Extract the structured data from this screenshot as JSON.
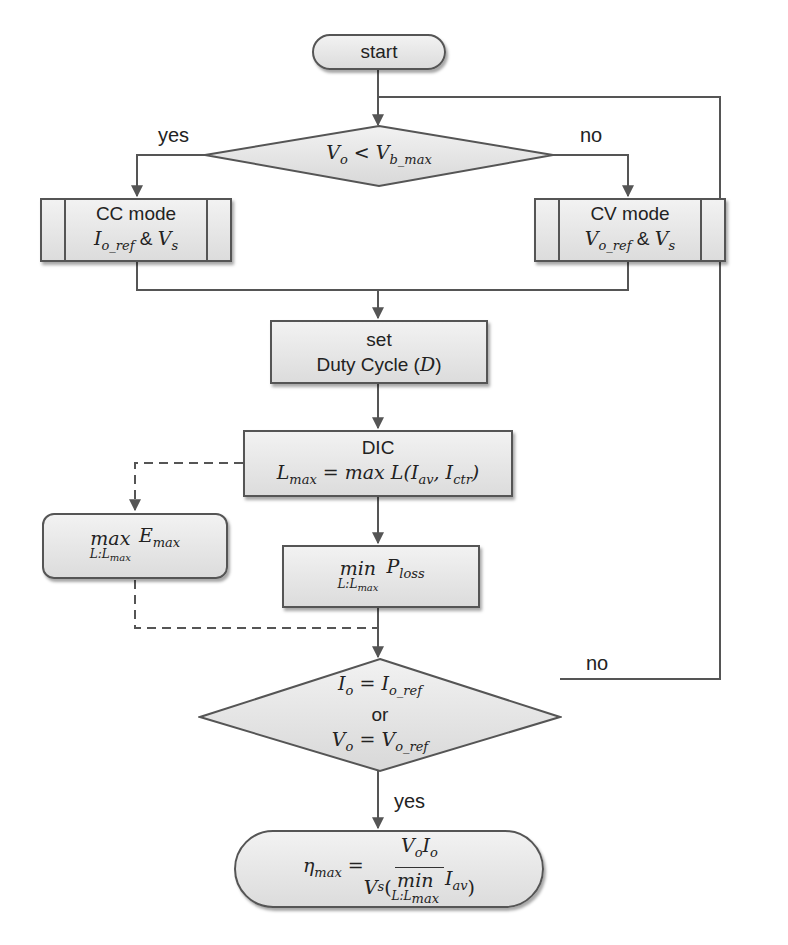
{
  "colors": {
    "stroke": "#555555",
    "fill_top": "#f2f2f2",
    "fill_bottom": "#dcdcdc",
    "text": "#222222"
  },
  "nodes": {
    "start": {
      "label": "start"
    },
    "decision1": {
      "lhs": "V",
      "lhs_sub": "o",
      "op": " < ",
      "rhs": "V",
      "rhs_sub": "b_max"
    },
    "cc_mode": {
      "title": "CC mode",
      "var": "I",
      "var_sub": "o_ref",
      "amp": " & ",
      "var2": "V",
      "var2_sub": "s"
    },
    "cv_mode": {
      "title": "CV mode",
      "var": "V",
      "var_sub": "o_ref",
      "amp": " & ",
      "var2": "V",
      "var2_sub": "s"
    },
    "set_duty": {
      "line1": "set",
      "line2": "Duty Cycle (",
      "var": "D",
      "close": ")"
    },
    "dic": {
      "title": "DIC",
      "lhs": "L",
      "lhs_sub": "max",
      "eq": " = max L(",
      "a": "I",
      "a_sub": "av",
      "comma": ", ",
      "b": "I",
      "b_sub": "ctr",
      "close": ")"
    },
    "max_e": {
      "op": "max",
      "limit": "L:L",
      "limit_sub": "max",
      "var": "E",
      "var_sub": "max"
    },
    "min_p": {
      "op": "min",
      "limit": "L:L",
      "limit_sub": "max",
      "var": "P",
      "var_sub": "loss"
    },
    "decision2": {
      "line1_lhs": "I",
      "line1_lhs_sub": "o",
      "line1_eq": " = ",
      "line1_rhs": "I",
      "line1_rhs_sub": "o_ref",
      "or": "or",
      "line2_lhs": "V",
      "line2_lhs_sub": "o",
      "line2_eq": " = ",
      "line2_rhs": "V",
      "line2_rhs_sub": "o_ref"
    },
    "end": {
      "lhs": "η",
      "lhs_sub": "max",
      "eq": " = ",
      "num_a": "V",
      "num_a_sub": "o",
      "num_b": "I",
      "num_b_sub": "o",
      "den_a": "V",
      "den_a_sub": "s",
      "den_op": "min",
      "den_limit": "L:L",
      "den_limit_sub": "max",
      "den_var": "I",
      "den_var_sub": "av"
    }
  },
  "labels": {
    "yes1": "yes",
    "no1": "no",
    "no2": "no",
    "yes2": "yes"
  }
}
